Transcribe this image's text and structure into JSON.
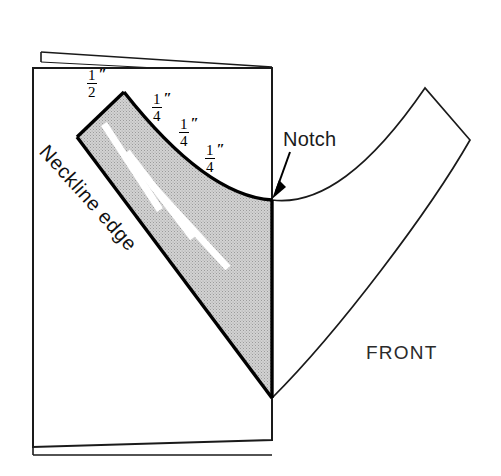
{
  "figure": {
    "type": "sewing-pattern-diagram",
    "background_color": "#ffffff",
    "ink_color": "#000000",
    "shade_color": "#c9c9c9"
  },
  "labels": {
    "notch": "Notch",
    "front": "FRONT",
    "neckline_edge": "Neckline edge",
    "inch_mark": "″"
  },
  "measurements": [
    {
      "id": "m1",
      "numerator": "1",
      "denominator": "2",
      "unit": "″",
      "text": "1/2″"
    },
    {
      "id": "m2",
      "numerator": "1",
      "denominator": "4",
      "unit": "″",
      "text": "1/4″"
    },
    {
      "id": "m3",
      "numerator": "1",
      "denominator": "4",
      "unit": "″",
      "text": "1/4″"
    },
    {
      "id": "m4",
      "numerator": "1",
      "denominator": "4",
      "unit": "″",
      "text": "1/4″"
    }
  ]
}
